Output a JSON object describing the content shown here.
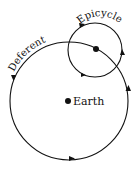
{
  "diagram": {
    "labels": {
      "deferent": "Deferent",
      "epicycle": "Epicycle",
      "earth": "Earth"
    },
    "colors": {
      "stroke": "#111111",
      "background": "#ffffff"
    }
  }
}
